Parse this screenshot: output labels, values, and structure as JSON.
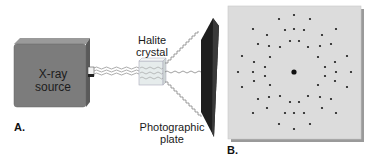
{
  "figure": {
    "panel_a": {
      "label": "A.",
      "xray_source": {
        "line1": "X-ray",
        "line2": "source"
      },
      "crystal": {
        "line1": "Halite",
        "line2": "crystal"
      },
      "plate": {
        "line1": "Photographic",
        "line2": "plate"
      }
    },
    "panel_b": {
      "label": "B.",
      "center_spot": {
        "x": 294,
        "y": 72
      },
      "spots": [
        [
          294,
          15
        ],
        [
          279,
          19
        ],
        [
          310,
          19
        ],
        [
          253,
          29
        ],
        [
          285,
          30
        ],
        [
          294,
          29
        ],
        [
          304,
          30
        ],
        [
          336,
          29
        ],
        [
          267,
          35
        ],
        [
          322,
          35
        ],
        [
          290,
          41
        ],
        [
          299,
          41
        ],
        [
          258,
          44
        ],
        [
          269,
          46
        ],
        [
          280,
          47
        ],
        [
          308,
          47
        ],
        [
          320,
          46
        ],
        [
          331,
          44
        ],
        [
          242,
          56
        ],
        [
          270,
          57
        ],
        [
          318,
          57
        ],
        [
          347,
          56
        ],
        [
          254,
          62
        ],
        [
          335,
          62
        ],
        [
          265,
          67
        ],
        [
          325,
          67
        ],
        [
          238,
          72
        ],
        [
          253,
          72
        ],
        [
          336,
          72
        ],
        [
          351,
          72
        ],
        [
          265,
          76
        ],
        [
          325,
          76
        ],
        [
          254,
          81
        ],
        [
          335,
          81
        ],
        [
          242,
          87
        ],
        [
          270,
          85
        ],
        [
          318,
          85
        ],
        [
          347,
          87
        ],
        [
          280,
          96
        ],
        [
          308,
          96
        ],
        [
          258,
          99
        ],
        [
          269,
          97
        ],
        [
          320,
          97
        ],
        [
          331,
          99
        ],
        [
          290,
          102
        ],
        [
          299,
          102
        ],
        [
          267,
          108
        ],
        [
          322,
          108
        ],
        [
          253,
          113
        ],
        [
          285,
          113
        ],
        [
          294,
          113
        ],
        [
          304,
          113
        ],
        [
          336,
          113
        ],
        [
          279,
          124
        ],
        [
          310,
          124
        ],
        [
          294,
          129
        ]
      ]
    },
    "colors": {
      "source_box": "#7a7a7a",
      "plate_dark": "#1e1e1e",
      "diffraction_bg": "#dcdcdc",
      "spot": "#1a1a1a"
    }
  }
}
